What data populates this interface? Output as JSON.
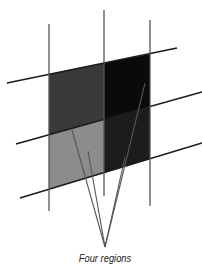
{
  "caption": "Four regions",
  "colors": {
    "top_left": "#3a3a3a",
    "top_right": "#0a0a0a",
    "bottom_left": "#8c8c8c",
    "bottom_right": "#1c1c1c",
    "line": "#1a1a1a",
    "vertical": "#555555",
    "pointer": "#555555"
  },
  "regions": [
    {
      "name": "top-left",
      "points": "49,74 104,63 104,119 49,135"
    },
    {
      "name": "top-right",
      "points": "104,63 150,54 150,107 104,119"
    },
    {
      "name": "bottom-left",
      "points": "49,135 104,119 104,173 49,189"
    },
    {
      "name": "bottom-right",
      "points": "104,119 150,107 150,159 104,173"
    }
  ],
  "horizontal_lines": [
    {
      "x1": 7,
      "y1": 83,
      "x2": 177,
      "y2": 48
    },
    {
      "x1": 16,
      "y1": 144,
      "x2": 202,
      "y2": 92
    },
    {
      "x1": 20,
      "y1": 198,
      "x2": 202,
      "y2": 143
    }
  ],
  "vertical_lines": [
    {
      "x": 49,
      "y1": 24,
      "y2": 211
    },
    {
      "x": 104,
      "y1": 10,
      "y2": 196
    },
    {
      "x": 150,
      "y1": 20,
      "y2": 206
    }
  ],
  "pointer_origin": {
    "x": 105,
    "y": 247
  },
  "pointer_targets": [
    {
      "x": 72,
      "y": 130
    },
    {
      "x": 88,
      "y": 151
    },
    {
      "x": 125,
      "y": 157
    },
    {
      "x": 145,
      "y": 83
    }
  ]
}
